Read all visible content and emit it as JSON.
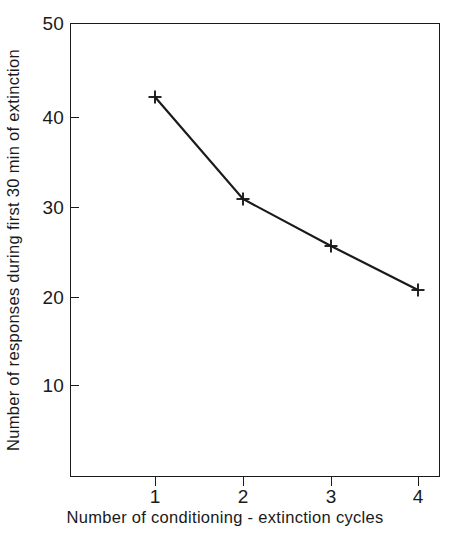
{
  "chart_data": {
    "type": "line",
    "title": "",
    "xlabel": "Number of  conditioning - extinction cycles",
    "ylabel": "Number of responses during first 30 min of extinction",
    "x": [
      1,
      2,
      3,
      4
    ],
    "values": [
      41.9,
      30.8,
      25.6,
      20.7
    ],
    "series": [
      {
        "name": "responses",
        "marker": "plus",
        "color": "#1a1a1a",
        "values": [
          41.9,
          30.8,
          25.6,
          20.7
        ]
      }
    ],
    "xticklabels": [
      "1",
      "2",
      "3",
      "4"
    ],
    "yticklabels": [
      "10",
      "20",
      "30",
      "40",
      "50"
    ],
    "xlim": [
      0.4,
      4.25
    ],
    "ylim": [
      1.0,
      50.0
    ],
    "grid": false,
    "legend": false,
    "legend_position": "none",
    "frame": "box",
    "line_color": "#1a1a1a",
    "background_color": "#ffffff"
  },
  "axes": {
    "y": {
      "ticks": [
        {
          "label": "50",
          "value": 50,
          "px": 23
        },
        {
          "label": "40",
          "value": 40,
          "px": 117
        },
        {
          "label": "30",
          "value": 30,
          "px": 207
        },
        {
          "label": "20",
          "value": 20,
          "px": 297
        },
        {
          "label": "10",
          "value": 10,
          "px": 385
        }
      ]
    },
    "x": {
      "ticks": [
        {
          "label": "1",
          "value": 1,
          "px": 155
        },
        {
          "label": "2",
          "value": 2,
          "px": 243
        },
        {
          "label": "3",
          "value": 3,
          "px": 331
        },
        {
          "label": "4",
          "value": 4,
          "px": 418
        }
      ]
    }
  },
  "points_px": [
    {
      "x": 155,
      "y": 97
    },
    {
      "x": 243,
      "y": 199
    },
    {
      "x": 331,
      "y": 246
    },
    {
      "x": 418,
      "y": 290
    }
  ]
}
